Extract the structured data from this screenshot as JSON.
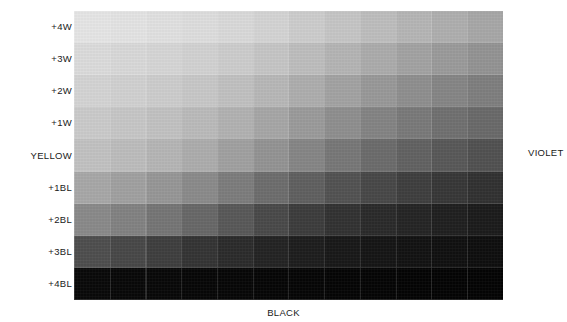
{
  "labels": {
    "left_axis": [
      "+4W",
      "+3W",
      "+2W",
      "+1W",
      "YELLOW",
      "+1BL",
      "+2BL",
      "+3BL",
      "+4BL"
    ],
    "right_axis": "VIOLET",
    "bottom_axis": "BLACK"
  },
  "chart_data": {
    "type": "heatmap",
    "title": "",
    "subtitle": "",
    "xlabel": "BLACK",
    "ylabel": "",
    "right_label": "VIOLET",
    "grid": false,
    "legend": "none",
    "columns": 12,
    "rows": 9,
    "row_labels": [
      "+4W",
      "+3W",
      "+2W",
      "+1W",
      "YELLOW",
      "+1BL",
      "+2BL",
      "+3BL",
      "+4BL"
    ],
    "column_labels": [
      "1",
      "2",
      "3",
      "4",
      "5",
      "6",
      "7",
      "8",
      "9",
      "10",
      "11",
      "12"
    ],
    "cell_colors": [
      [
        "#e6e6e6",
        "#e4e4e4",
        "#e1e1e1",
        "#dedede",
        "#dadada",
        "#d4d4d4",
        "#cdcdcd",
        "#c6c6c6",
        "#bebebe",
        "#b6b6b6",
        "#afafaf",
        "#a8a8a8"
      ],
      [
        "#dcdcdc",
        "#d9d9d9",
        "#d6d6d6",
        "#d2d2d2",
        "#cdcdcd",
        "#c6c6c6",
        "#bebebe",
        "#b5b5b5",
        "#acacac",
        "#a3a3a3",
        "#9b9b9b",
        "#949494"
      ],
      [
        "#d4d4d4",
        "#d1d1d1",
        "#cdcdcd",
        "#c8c8c8",
        "#c1c1c1",
        "#b8b8b8",
        "#aeaeae",
        "#a3a3a3",
        "#999999",
        "#8f8f8f",
        "#868686",
        "#7f7f7f"
      ],
      [
        "#cbcbcb",
        "#c7c7c7",
        "#c2c2c2",
        "#bbbbbb",
        "#b2b2b2",
        "#a7a7a7",
        "#9b9b9b",
        "#8f8f8f",
        "#848484",
        "#7a7a7a",
        "#717171",
        "#6a6a6a"
      ],
      [
        "#c2c2c2",
        "#bdbdbd",
        "#b6b6b6",
        "#adadad",
        "#a1a1a1",
        "#949494",
        "#868686",
        "#787878",
        "#6c6c6c",
        "#626262",
        "#595959",
        "#525252"
      ],
      [
        "#a8a8a8",
        "#a1a1a1",
        "#979797",
        "#8b8b8b",
        "#7d7d7d",
        "#6e6e6e",
        "#606060",
        "#535353",
        "#484848",
        "#3f3f3f",
        "#383838",
        "#323232"
      ],
      [
        "#8a8a8a",
        "#828282",
        "#767676",
        "#686868",
        "#595959",
        "#4a4a4a",
        "#3d3d3d",
        "#333333",
        "#2b2b2b",
        "#252525",
        "#202020",
        "#1c1c1c"
      ],
      [
        "#4f4f4f",
        "#484848",
        "#3f3f3f",
        "#353535",
        "#2c2c2c",
        "#242424",
        "#1e1e1e",
        "#191919",
        "#161616",
        "#131313",
        "#111111",
        "#0f0f0f"
      ],
      [
        "#0a0a0a",
        "#090909",
        "#090909",
        "#080808",
        "#080808",
        "#070707",
        "#070707",
        "#060606",
        "#060606",
        "#050505",
        "#050505",
        "#050505"
      ]
    ]
  },
  "colors": {
    "background": "#ffffff",
    "text": "#1a1a1a"
  }
}
